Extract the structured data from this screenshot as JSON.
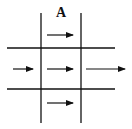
{
  "diagram": {
    "label": "A",
    "arrows": [
      {
        "id": "top-center",
        "direction": "right"
      },
      {
        "id": "middle-left",
        "direction": "right"
      },
      {
        "id": "middle-center",
        "direction": "right"
      },
      {
        "id": "middle-right",
        "direction": "right"
      },
      {
        "id": "bottom-center",
        "direction": "right"
      }
    ],
    "colors": {
      "line": "#111111",
      "background": "#ffffff"
    }
  }
}
